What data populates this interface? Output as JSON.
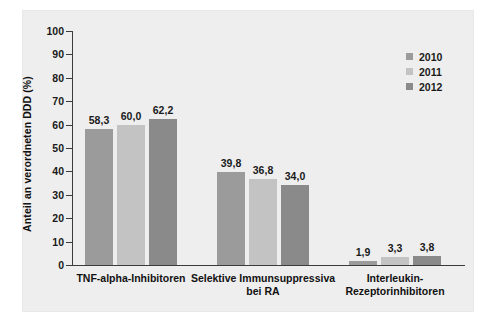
{
  "chart_data": {
    "type": "bar",
    "title": "",
    "xlabel": "",
    "ylabel": "Anteil an verordneten DDD (%)",
    "ylim": [
      0,
      100
    ],
    "ytick_labels": [
      "100",
      "90",
      "80",
      "70",
      "60",
      "50",
      "40",
      "30",
      "20",
      "10",
      "0"
    ],
    "ytick_values": [
      100,
      90,
      80,
      70,
      60,
      50,
      40,
      30,
      20,
      10,
      0
    ],
    "grid": false,
    "legend_position": "top-right",
    "categories": [
      "TNF-alpha-Inhibitoren",
      "Selektive Immunsuppressiva bei RA",
      "Interleukin-Rezeptorinhibitoren"
    ],
    "category_lines": [
      [
        "TNF-alpha-Inhibitoren"
      ],
      [
        "Selektive Immunsuppressiva",
        "bei RA"
      ],
      [
        "Interleukin-",
        "Rezeptorinhibitoren"
      ]
    ],
    "series": [
      {
        "name": "2010",
        "color": "#9b9b9b",
        "values": [
          58.3,
          39.8,
          1.9
        ],
        "labels": [
          "58,3",
          "39,8",
          "1,9"
        ]
      },
      {
        "name": "2011",
        "color": "#c3c3c3",
        "values": [
          60.0,
          36.8,
          3.3
        ],
        "labels": [
          "60,0",
          "36,8",
          "3,3"
        ]
      },
      {
        "name": "2012",
        "color": "#8a8a8a",
        "values": [
          62.2,
          34.0,
          3.8
        ],
        "labels": [
          "62,2",
          "34,0",
          "3,8"
        ]
      }
    ]
  },
  "legend": {
    "items": [
      {
        "label": "2010",
        "color": "#9b9b9b"
      },
      {
        "label": "2011",
        "color": "#c3c3c3"
      },
      {
        "label": "2012",
        "color": "#8a8a8a"
      }
    ]
  }
}
